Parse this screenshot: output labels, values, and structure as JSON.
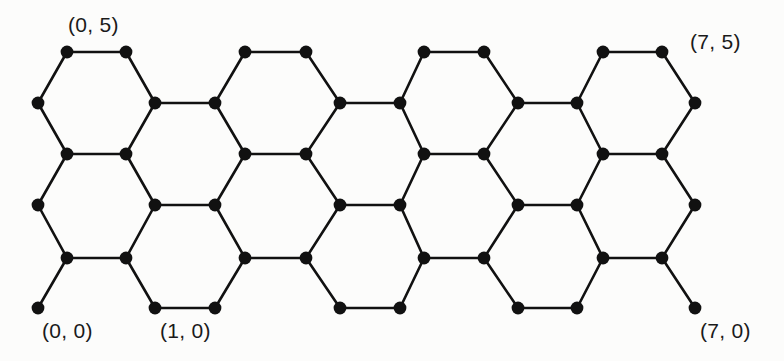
{
  "figure": {
    "kind": "hexagonal-lattice-diagram",
    "background_color": "#fcfcfb",
    "stroke_color": "#111111",
    "node_color": "#111111",
    "edge_width": 2.6,
    "node_radius": 6.4,
    "width": 784,
    "height": 361
  },
  "lattice": {
    "description": "Honeycomb (hexagonal) lattice drawn as a brick-wall of hexagons, 6 node-rows tall and 16 node-columns wide, with pendant stubs on the bottom row.",
    "columns_a": [
      38,
      155,
      215,
      340,
      400,
      518,
      577,
      695
    ],
    "columns_b": [
      67,
      126,
      245,
      306,
      424,
      484,
      603,
      662
    ],
    "rows_a": [
      103,
      205,
      308
    ],
    "rows_b": [
      52,
      154,
      258
    ],
    "nodes": [
      {
        "id": "b0r0",
        "x": 67,
        "y": 52
      },
      {
        "id": "b1r0",
        "x": 126,
        "y": 52
      },
      {
        "id": "b2r0",
        "x": 245,
        "y": 52
      },
      {
        "id": "b3r0",
        "x": 306,
        "y": 52
      },
      {
        "id": "b4r0",
        "x": 424,
        "y": 52
      },
      {
        "id": "b5r0",
        "x": 484,
        "y": 52
      },
      {
        "id": "b6r0",
        "x": 603,
        "y": 52
      },
      {
        "id": "b7r0",
        "x": 662,
        "y": 52
      },
      {
        "id": "a0r1",
        "x": 38,
        "y": 103
      },
      {
        "id": "a1r1",
        "x": 155,
        "y": 103
      },
      {
        "id": "a2r1",
        "x": 215,
        "y": 103
      },
      {
        "id": "a3r1",
        "x": 340,
        "y": 103
      },
      {
        "id": "a4r1",
        "x": 400,
        "y": 103
      },
      {
        "id": "a5r1",
        "x": 518,
        "y": 103
      },
      {
        "id": "a6r1",
        "x": 577,
        "y": 103
      },
      {
        "id": "a7r1",
        "x": 695,
        "y": 103
      },
      {
        "id": "b0r2",
        "x": 67,
        "y": 154
      },
      {
        "id": "b1r2",
        "x": 126,
        "y": 154
      },
      {
        "id": "b2r2",
        "x": 245,
        "y": 154
      },
      {
        "id": "b3r2",
        "x": 306,
        "y": 154
      },
      {
        "id": "b4r2",
        "x": 424,
        "y": 154
      },
      {
        "id": "b5r2",
        "x": 484,
        "y": 154
      },
      {
        "id": "b6r2",
        "x": 603,
        "y": 154
      },
      {
        "id": "b7r2",
        "x": 662,
        "y": 154
      },
      {
        "id": "a0r3",
        "x": 38,
        "y": 205
      },
      {
        "id": "a1r3",
        "x": 155,
        "y": 205
      },
      {
        "id": "a2r3",
        "x": 215,
        "y": 205
      },
      {
        "id": "a3r3",
        "x": 340,
        "y": 205
      },
      {
        "id": "a4r3",
        "x": 400,
        "y": 205
      },
      {
        "id": "a5r3",
        "x": 518,
        "y": 205
      },
      {
        "id": "a6r3",
        "x": 577,
        "y": 205
      },
      {
        "id": "a7r3",
        "x": 695,
        "y": 205
      },
      {
        "id": "b0r4",
        "x": 67,
        "y": 258
      },
      {
        "id": "b1r4",
        "x": 126,
        "y": 258
      },
      {
        "id": "b2r4",
        "x": 245,
        "y": 258
      },
      {
        "id": "b3r4",
        "x": 306,
        "y": 258
      },
      {
        "id": "b4r4",
        "x": 424,
        "y": 258
      },
      {
        "id": "b5r4",
        "x": 484,
        "y": 258
      },
      {
        "id": "b6r4",
        "x": 603,
        "y": 258
      },
      {
        "id": "b7r4",
        "x": 662,
        "y": 258
      },
      {
        "id": "a0r5",
        "x": 38,
        "y": 308
      },
      {
        "id": "a1r5",
        "x": 155,
        "y": 308
      },
      {
        "id": "a2r5",
        "x": 215,
        "y": 308
      },
      {
        "id": "a3r5",
        "x": 340,
        "y": 308
      },
      {
        "id": "a4r5",
        "x": 400,
        "y": 308
      },
      {
        "id": "a5r5",
        "x": 518,
        "y": 308
      },
      {
        "id": "a6r5",
        "x": 577,
        "y": 308
      },
      {
        "id": "a7r5",
        "x": 695,
        "y": 308
      }
    ],
    "edges": [
      [
        "b0r0",
        "b1r0"
      ],
      [
        "b2r0",
        "b3r0"
      ],
      [
        "b4r0",
        "b5r0"
      ],
      [
        "b6r0",
        "b7r0"
      ],
      [
        "b0r0",
        "a0r1"
      ],
      [
        "b1r0",
        "a1r1"
      ],
      [
        "b2r0",
        "a2r1"
      ],
      [
        "b3r0",
        "a3r1"
      ],
      [
        "b4r0",
        "a4r1"
      ],
      [
        "b5r0",
        "a5r1"
      ],
      [
        "b6r0",
        "a6r1"
      ],
      [
        "b7r0",
        "a7r1"
      ],
      [
        "a1r1",
        "a2r1"
      ],
      [
        "a3r1",
        "a4r1"
      ],
      [
        "a5r1",
        "a6r1"
      ],
      [
        "a0r1",
        "b0r2"
      ],
      [
        "a1r1",
        "b1r2"
      ],
      [
        "a2r1",
        "b2r2"
      ],
      [
        "a3r1",
        "b3r2"
      ],
      [
        "a4r1",
        "b4r2"
      ],
      [
        "a5r1",
        "b5r2"
      ],
      [
        "a6r1",
        "b6r2"
      ],
      [
        "a7r1",
        "b7r2"
      ],
      [
        "b0r2",
        "b1r2"
      ],
      [
        "b2r2",
        "b3r2"
      ],
      [
        "b4r2",
        "b5r2"
      ],
      [
        "b6r2",
        "b7r2"
      ],
      [
        "b0r2",
        "a0r3"
      ],
      [
        "b1r2",
        "a1r3"
      ],
      [
        "b2r2",
        "a2r3"
      ],
      [
        "b3r2",
        "a3r3"
      ],
      [
        "b4r2",
        "a4r3"
      ],
      [
        "b5r2",
        "a5r3"
      ],
      [
        "b6r2",
        "a6r3"
      ],
      [
        "b7r2",
        "a7r3"
      ],
      [
        "a1r3",
        "a2r3"
      ],
      [
        "a3r3",
        "a4r3"
      ],
      [
        "a5r3",
        "a6r3"
      ],
      [
        "a0r3",
        "b0r4"
      ],
      [
        "a1r3",
        "b1r4"
      ],
      [
        "a2r3",
        "b2r4"
      ],
      [
        "a3r3",
        "b3r4"
      ],
      [
        "a4r3",
        "b4r4"
      ],
      [
        "a5r3",
        "b5r4"
      ],
      [
        "a6r3",
        "b6r4"
      ],
      [
        "a7r3",
        "b7r4"
      ],
      [
        "b0r4",
        "b1r4"
      ],
      [
        "b2r4",
        "b3r4"
      ],
      [
        "b4r4",
        "b5r4"
      ],
      [
        "b6r4",
        "b7r4"
      ],
      [
        "b0r4",
        "a0r5"
      ],
      [
        "b1r4",
        "a1r5"
      ],
      [
        "b2r4",
        "a2r5"
      ],
      [
        "b3r4",
        "a3r5"
      ],
      [
        "b4r4",
        "a4r5"
      ],
      [
        "b5r4",
        "a5r5"
      ],
      [
        "b6r4",
        "a6r5"
      ],
      [
        "b7r4",
        "a7r5"
      ],
      [
        "a1r5",
        "a2r5"
      ],
      [
        "a3r5",
        "a4r5"
      ],
      [
        "a5r5",
        "a6r5"
      ]
    ]
  },
  "labels": [
    {
      "name": "label-0-5",
      "text": "(0, 5)",
      "x": 68,
      "y": 14,
      "anchor": "start"
    },
    {
      "name": "label-7-5",
      "text": "(7, 5)",
      "x": 690,
      "y": 31,
      "anchor": "start"
    },
    {
      "name": "label-0-0",
      "text": "(0, 0)",
      "x": 42,
      "y": 320,
      "anchor": "start"
    },
    {
      "name": "label-1-0",
      "text": "(1, 0)",
      "x": 160,
      "y": 320,
      "anchor": "start"
    },
    {
      "name": "label-7-0",
      "text": "(7, 0)",
      "x": 700,
      "y": 320,
      "anchor": "start"
    }
  ]
}
